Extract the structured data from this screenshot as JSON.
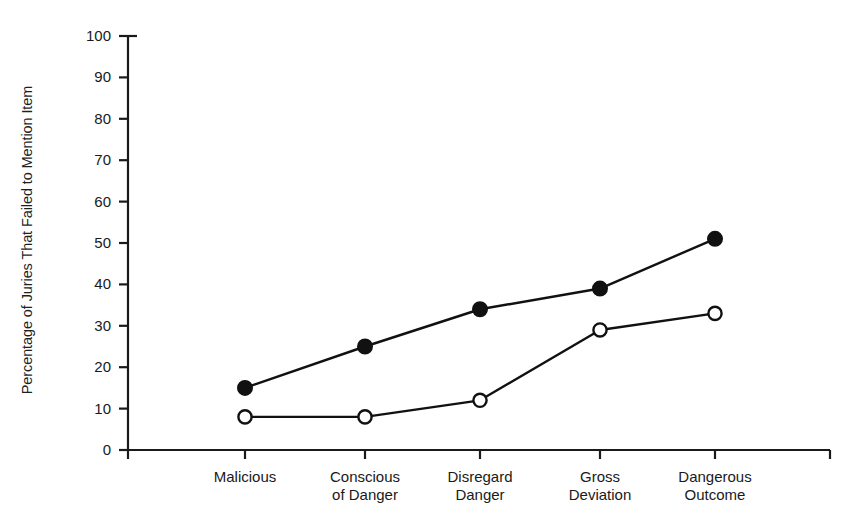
{
  "chart_data": {
    "type": "line",
    "title": "",
    "xlabel": "",
    "ylabel": "Percentage of Juries That Failed to Mention Item",
    "categories": [
      "Malicious",
      "Conscious\nof Danger",
      "Disregard\nDanger",
      "Gross\nDeviation",
      "Dangerous\nOutcome"
    ],
    "ylim": [
      0,
      100
    ],
    "ytick_labels": [
      "0",
      "10",
      "20",
      "30",
      "40",
      "50",
      "60",
      "70",
      "80",
      "90",
      "100"
    ],
    "ytick_values": [
      0,
      10,
      20,
      30,
      40,
      50,
      60,
      70,
      80,
      90,
      100
    ],
    "grid": false,
    "legend": "none",
    "series": [
      {
        "name": "filled-circle-series",
        "marker": "filled-circle",
        "color": "#111111",
        "values": [
          15,
          25,
          34,
          39,
          51
        ]
      },
      {
        "name": "open-circle-series",
        "marker": "open-circle",
        "color": "#111111",
        "values": [
          8,
          8,
          12,
          29,
          33
        ]
      }
    ]
  },
  "axis": {
    "line_color": "#1a1a1a"
  }
}
